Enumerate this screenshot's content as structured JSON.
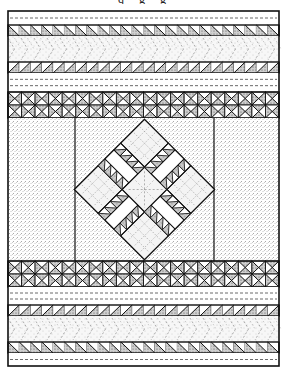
{
  "title_fragment": "q g g",
  "colors": {
    "background": "#ffffff",
    "line": "#111111",
    "stipple": "#555555",
    "light_fill": "#f4f4f4",
    "shade_fill": "#bdbdbd",
    "dash": "#444444"
  },
  "quilt": {
    "x": 8,
    "y": 11,
    "width": 271,
    "height": 355,
    "bands": [
      {
        "name": "top-white-strip",
        "type": "white-strip",
        "y0": 11,
        "y1": 25,
        "dash_lines": 1
      },
      {
        "name": "triangle-row-1",
        "type": "triangle-row",
        "y0": 25,
        "y1": 36,
        "direction": "back"
      },
      {
        "name": "dotted-band-1",
        "type": "dotted-band",
        "y0": 36,
        "y1": 62
      },
      {
        "name": "triangle-row-2",
        "type": "triangle-row",
        "y0": 62,
        "y1": 73,
        "direction": "forward"
      },
      {
        "name": "white-strip-upper",
        "type": "white-strip",
        "y0": 73,
        "y1": 92,
        "dash_lines": 2
      },
      {
        "name": "hourglass-band-upper",
        "type": "hourglass-band",
        "y0": 92,
        "y1": 118
      },
      {
        "name": "center-field",
        "type": "center-field",
        "y0": 118,
        "y1": 261
      },
      {
        "name": "hourglass-band-lower",
        "type": "hourglass-band",
        "y0": 261,
        "y1": 287
      },
      {
        "name": "white-strip-lower",
        "type": "white-strip",
        "y0": 287,
        "y1": 305,
        "dash_lines": 2
      },
      {
        "name": "triangle-row-3",
        "type": "triangle-row",
        "y0": 305,
        "y1": 316,
        "direction": "forward"
      },
      {
        "name": "dotted-band-2",
        "type": "dotted-band",
        "y0": 316,
        "y1": 342
      },
      {
        "name": "triangle-row-4",
        "type": "triangle-row",
        "y0": 342,
        "y1": 353,
        "direction": "back"
      },
      {
        "name": "bottom-white-strip",
        "type": "white-strip",
        "y0": 353,
        "y1": 366,
        "dash_lines": 1
      }
    ],
    "center_field": {
      "left_divider_x": 75,
      "right_divider_x": 214,
      "medallion": {
        "cx": 144.5,
        "cy": 189.5,
        "half_diagonal": 70
      }
    },
    "triangle_cell_width": 11.29,
    "hourglass_cell_width": 13.55
  }
}
